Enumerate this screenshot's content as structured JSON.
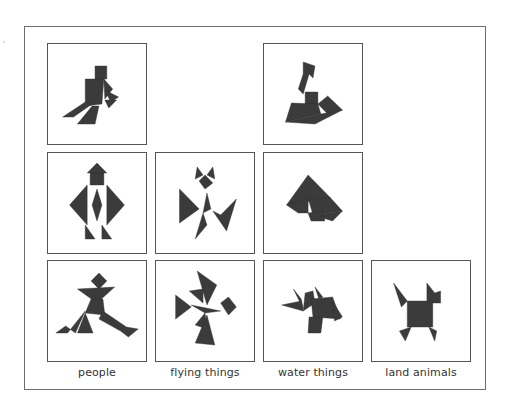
{
  "figure": {
    "shape_color": "#3b3b3b",
    "border_color": "#555555",
    "categories": [
      {
        "label": "people",
        "col": 0
      },
      {
        "label": "flying things",
        "col": 1
      },
      {
        "label": "water things",
        "col": 2
      },
      {
        "label": "land animals",
        "col": 3
      }
    ],
    "columns_x": [
      47,
      155,
      263,
      371
    ],
    "rows_y": [
      43,
      152,
      260
    ],
    "cells": [
      {
        "id": "people-sitting",
        "category": "people",
        "row": 0,
        "col": 0,
        "polys": [
          "48,22 60,22 60,35 48,35",
          "38,35 57,35 55,60 38,62",
          "57,35 66,45 58,55",
          "58,46 72,53 64,58",
          "58,56 70,56 62,64",
          "38,58 48,58 26,73 15,73",
          "45,62 52,62 48,80 30,80"
        ]
      },
      {
        "id": "boat",
        "category": "water things",
        "row": 0,
        "col": 2,
        "polys": [
          "40,18 52,22 50,34 46,30 40,50 35,45 40,30",
          "42,48 55,48 55,60 42,60",
          "28,59 55,60 58,70 22,78",
          "55,60 65,52 80,66 65,70",
          "22,78 58,70 80,66 52,80"
        ]
      },
      {
        "id": "person-standing",
        "category": "people",
        "row": 1,
        "col": 0,
        "polys": [
          "40,20 50,10 60,20",
          "43,20 57,20 57,32 43,32",
          "40,32 22,52 40,72",
          "60,32 78,52 60,72",
          "50,36 45,52 50,68 55,52",
          "38,72 38,86 48,86",
          "55,72 55,86 65,86"
        ]
      },
      {
        "id": "bird-figure",
        "category": "flying things",
        "row": 1,
        "col": 1,
        "polys": [
          "42,14 48,22 40,26",
          "58,14 60,26 52,22",
          "44,28 50,22 58,30 50,36",
          "24,36 44,56 24,70",
          "52,40 56,56 48,60",
          "82,46 66,62 58,58 72,78",
          "48,60 52,72 40,86"
        ]
      },
      {
        "id": "sailboat-mound",
        "category": "water things",
        "row": 1,
        "col": 2,
        "polys": [
          "45,22 68,45 23,52",
          "23,52 45,45 45,60 35,60",
          "45,45 68,45 80,58 50,62",
          "50,62 80,58 70,68",
          "45,60 60,58 62,68 48,68"
        ]
      },
      {
        "id": "person-running",
        "category": "people",
        "row": 2,
        "col": 0,
        "polys": [
          "44,20 52,12 60,20 52,28",
          "30,28 68,26 50,42",
          "44,38 56,38 58,54 38,52",
          "38,50 28,72 18,65 8,72 20,72",
          "38,52 30,72 46,72",
          "56,50 80,66 92,68 82,76 74,70 52,58"
        ]
      },
      {
        "id": "pinwheel",
        "category": "flying things",
        "row": 2,
        "col": 1,
        "polys": [
          "42,10 62,24 52,44",
          "34,30 48,28 48,42",
          "20,34 20,58 36,46",
          "36,44 66,50 50,52",
          "66,42 74,36 82,46 74,54",
          "50,52 52,68 40,64",
          "52,54 60,84 40,82"
        ]
      },
      {
        "id": "fish",
        "category": "water things",
        "row": 2,
        "col": 2,
        "polys": [
          "30,28 38,38 40,48",
          "18,44 38,40 40,50",
          "42,32 50,30 52,42 40,50",
          "52,26 56,38 60,36",
          "48,38 70,36 78,58 50,56",
          "70,40 80,56 72,60",
          "46,56 60,56 58,72 45,72"
        ]
      },
      {
        "id": "dog",
        "category": "land animals",
        "row": 2,
        "col": 3,
        "polys": [
          "22,22 36,40 30,46",
          "56,22 64,32 70,30 70,42 56,42",
          "36,40 62,40 62,66 36,66",
          "28,70 40,66 34,80",
          "58,66 66,70 64,80"
        ]
      }
    ]
  }
}
